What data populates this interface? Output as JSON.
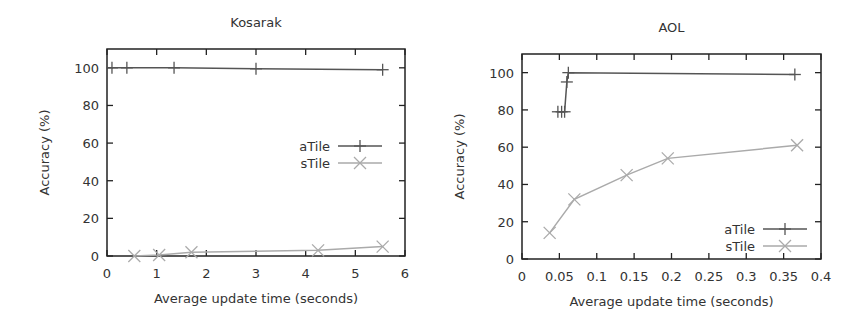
{
  "chart_data": [
    {
      "type": "line",
      "title": "Kosarak",
      "xlabel": "Average update time (seconds)",
      "ylabel": "Accuracy (%)",
      "xlim": [
        0,
        6
      ],
      "ylim": [
        0,
        110
      ],
      "xticks": [
        0,
        1,
        2,
        3,
        4,
        5,
        6
      ],
      "xtick_labels": [
        "0",
        "1",
        "2",
        "3",
        "4",
        "5",
        "6"
      ],
      "yticks": [
        0,
        20,
        40,
        60,
        80,
        100
      ],
      "ytick_labels": [
        "0",
        "20",
        "40",
        "60",
        "80",
        "100"
      ],
      "grid": false,
      "legend_position": "center-right",
      "series": [
        {
          "name": "aTile",
          "marker": "plus",
          "color": "#555555",
          "x": [
            0.1,
            0.4,
            1.35,
            3.0,
            5.55
          ],
          "y": [
            100,
            100,
            100,
            99.5,
            99
          ]
        },
        {
          "name": "sTile",
          "marker": "cross",
          "color": "#aaaaaa",
          "x": [
            0.55,
            1.05,
            1.7,
            4.25,
            5.55
          ],
          "y": [
            0,
            0.5,
            2,
            3,
            5
          ]
        }
      ]
    },
    {
      "type": "line",
      "title": "AOL",
      "xlabel": "Average update time (seconds)",
      "ylabel": "Accuracy (%)",
      "xlim": [
        0,
        0.4
      ],
      "ylim": [
        0,
        110
      ],
      "xticks": [
        0,
        0.05,
        0.1,
        0.15,
        0.2,
        0.25,
        0.3,
        0.35,
        0.4
      ],
      "xtick_labels": [
        "0",
        "0.05",
        "0.1",
        "0.15",
        "0.2",
        "0.25",
        "0.3",
        "0.35",
        "0.4"
      ],
      "yticks": [
        0,
        20,
        40,
        60,
        80,
        100
      ],
      "ytick_labels": [
        "0",
        "20",
        "40",
        "60",
        "80",
        "100"
      ],
      "grid": false,
      "legend_position": "bottom-right",
      "series": [
        {
          "name": "aTile",
          "marker": "plus",
          "color": "#555555",
          "x": [
            0.048,
            0.053,
            0.057,
            0.06,
            0.062,
            0.365
          ],
          "y": [
            79,
            79,
            79,
            95,
            100,
            99
          ]
        },
        {
          "name": "sTile",
          "marker": "cross",
          "color": "#aaaaaa",
          "x": [
            0.037,
            0.07,
            0.14,
            0.195,
            0.368
          ],
          "y": [
            14,
            32,
            45,
            54,
            61
          ]
        }
      ]
    }
  ],
  "layout": [
    {
      "box": {
        "left": 107,
        "top": 49,
        "right": 405,
        "bottom": 256
      },
      "legend": {
        "x": 330,
        "y": 146
      }
    },
    {
      "box": {
        "left": 522,
        "top": 54,
        "right": 821,
        "bottom": 259
      },
      "legend": {
        "x": 755,
        "y": 229
      }
    }
  ]
}
